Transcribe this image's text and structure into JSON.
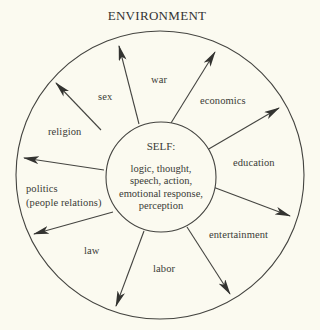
{
  "title": "ENVIRONMENT",
  "colors": {
    "background": "#fbfaf0",
    "ink": "#3a3a36",
    "line": "#444440"
  },
  "outer_circle": {
    "cx": 160,
    "cy": 175,
    "r": 144
  },
  "inner_circle": {
    "cx": 161,
    "cy": 177,
    "r": 55
  },
  "self": {
    "title": "SELF:",
    "lines": [
      "logic, thought,",
      "speech, action,",
      "emotional response,",
      "perception"
    ]
  },
  "arrows": [
    {
      "x1": 101,
      "y1": 130,
      "x2": 56,
      "y2": 83
    },
    {
      "x1": 139,
      "y1": 124,
      "x2": 119,
      "y2": 46
    },
    {
      "x1": 171,
      "y1": 123,
      "x2": 215,
      "y2": 52
    },
    {
      "x1": 207,
      "y1": 150,
      "x2": 279,
      "y2": 108
    },
    {
      "x1": 104,
      "y1": 170,
      "x2": 24,
      "y2": 158
    },
    {
      "x1": 213,
      "y1": 187,
      "x2": 290,
      "y2": 216
    },
    {
      "x1": 113,
      "y1": 212,
      "x2": 34,
      "y2": 234
    },
    {
      "x1": 144,
      "y1": 231,
      "x2": 116,
      "y2": 306
    },
    {
      "x1": 187,
      "y1": 227,
      "x2": 230,
      "y2": 294
    }
  ],
  "labels": {
    "war": "war",
    "sex": "sex",
    "economics": "economics",
    "religion": "religion",
    "education": "education",
    "politics": "politics",
    "politics_sub": "(people relations)",
    "entertainment": "entertainment",
    "law": "law",
    "labor": "labor"
  }
}
